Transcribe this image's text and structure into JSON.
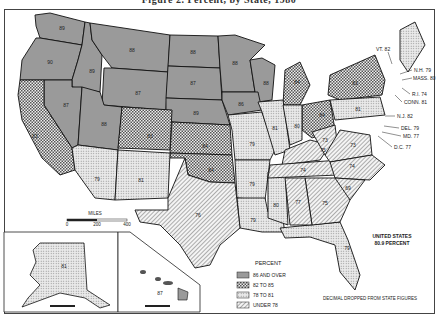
{
  "title": "Figure 2. Percent, by State, 1980",
  "categories": [
    {
      "id": "c1",
      "label": "86 AND OVER",
      "fill": "#9a9a9a",
      "pattern": "solid-gray"
    },
    {
      "id": "c2",
      "label": "82 TO 85",
      "fill": "url(#checker)",
      "pattern": "crosshatch"
    },
    {
      "id": "c3",
      "label": "78 TO 81",
      "fill": "url(#dots)",
      "pattern": "dotted"
    },
    {
      "id": "c4",
      "label": "UNDER 78",
      "fill": "url(#diag)",
      "pattern": "diagonal"
    }
  ],
  "legend": {
    "title": "PERCENT"
  },
  "us_total": {
    "line1": "UNITED STATES",
    "line2": "80.9 PERCENT"
  },
  "note": "DECIMAL DROPPED FROM STATE FIGURES",
  "scale": {
    "label": "MILES",
    "ticks": [
      "0",
      "200",
      "400"
    ]
  },
  "states": {
    "WA": "89",
    "OR": "90",
    "ID": "89",
    "MT": "88",
    "WY": "87",
    "ND": "88",
    "SD": "87",
    "NE": "89",
    "MN": "88",
    "WI": "88",
    "IA": "86",
    "NV": "87",
    "UT": "88",
    "CA": "83",
    "CO": "83",
    "KS": "84",
    "OK": "84",
    "MI": "84",
    "OH": "84",
    "NY": "83",
    "AZ": "79",
    "NM": "81",
    "MO": "79",
    "IL": "81",
    "IN": "80",
    "PA": "81",
    "AR": "79",
    "LA": "79",
    "MS": "80",
    "FL": "79",
    "AK": "81",
    "TX": "76",
    "TN": "74",
    "KY": "75",
    "WV": "73",
    "VA": "73",
    "NC": "74",
    "SC": "69",
    "GA": "75",
    "AL": "77",
    "HI": "87"
  },
  "callouts": {
    "VT": "VT. 82",
    "ME": "81",
    "NH": "N.H. 79",
    "MA": "MASS. 80",
    "RI": "R.I. 74",
    "CT": "CONN. 81",
    "NJ": "N.J. 82",
    "DE": "DEL. 79",
    "MD": "MD. 77",
    "DC": "D.C. 77"
  }
}
